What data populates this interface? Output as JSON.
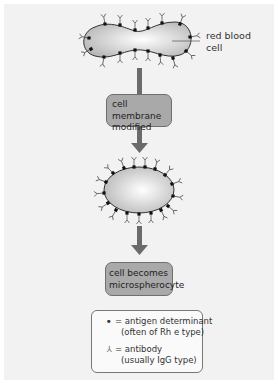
{
  "diagram": {
    "topic": "Formation of microspherocyte via antibody binding to red blood cell membrane",
    "colors": {
      "panel_background": "#f2f2f2",
      "box_fill": "#a9a9a9",
      "arrow": "#6b6b6b",
      "cell_fill_light": "#ffffff",
      "cell_fill_dark": "#bdbdbd",
      "antigen_dot": "#111111"
    },
    "cell_label": {
      "line1": "red blood",
      "line2": "cell"
    },
    "steps": [
      {
        "line1": "cell membrane",
        "line2": "modified"
      },
      {
        "line1": "cell becomes",
        "line2": "microspherocyte"
      }
    ],
    "legend": {
      "antigen": {
        "symbol": "•",
        "icon": "filled-dot",
        "line1": "= antigen determinant",
        "line2": "(often of Rh e type)"
      },
      "antibody": {
        "symbol": "⅄",
        "icon": "y-shaped-antibody",
        "line1": "= antibody",
        "line2": "(usually IgG type)"
      }
    }
  }
}
